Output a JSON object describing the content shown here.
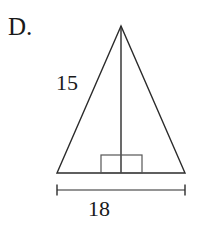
{
  "figure": {
    "choice_letter": "D.",
    "shape": "isosceles-triangle-with-altitude-and-right-angle-mark",
    "labels": {
      "slant_side": "15",
      "base": "18"
    },
    "colors": {
      "stroke": "#2b2b2b",
      "text": "#1a1a1a",
      "background": "#ffffff"
    },
    "geometry": {
      "apex": [
        121,
        26
      ],
      "base_left": [
        57,
        173
      ],
      "base_right": [
        185,
        173
      ],
      "altitude_foot": [
        121,
        173
      ],
      "right_angle_box": {
        "x": 101,
        "y": 155,
        "width": 41,
        "height": 18
      },
      "dimension_line": {
        "y": 190,
        "x_start": 57,
        "x_end": 185,
        "tick_height": 11
      }
    }
  }
}
